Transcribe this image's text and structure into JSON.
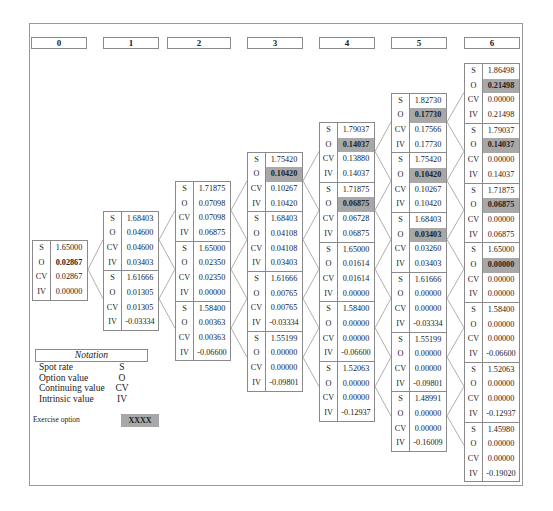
{
  "headers": [
    "0",
    "1",
    "2",
    "3",
    "4",
    "5",
    "6"
  ],
  "row_labels": [
    "S",
    "O",
    "CV",
    "IV"
  ],
  "colors": {
    "exercise_highlight": "#a8a8a8",
    "border": "#8a8a8a"
  },
  "columns": [
    {
      "step": "0",
      "nodes": [
        {
          "S": "1.65000",
          "O": "0.02867",
          "CV": "0.02867",
          "IV": "0.00000",
          "o_style": "bold"
        }
      ]
    },
    {
      "step": "1",
      "nodes": [
        {
          "S": "1.68403",
          "O": "0.04600",
          "CV": "0.04600",
          "IV": "0.03403"
        },
        {
          "S": "1.61666",
          "O": "0.01305",
          "CV": "0.01305",
          "IV": "-0.03334"
        }
      ]
    },
    {
      "step": "2",
      "nodes": [
        {
          "S": "1.71875",
          "O": "0.07098",
          "CV": "0.07098",
          "IV": "0.06875"
        },
        {
          "S": "1.65000",
          "O": "0.02350",
          "CV": "0.02350",
          "IV": "0.00000"
        },
        {
          "S": "1.58400",
          "O": "0.00363",
          "CV": "0.00363",
          "IV": "-0.06600"
        }
      ]
    },
    {
      "step": "3",
      "nodes": [
        {
          "S": "1.75420",
          "O": "0.10420",
          "CV": "0.10267",
          "IV": "0.10420",
          "o_style": "exercise"
        },
        {
          "S": "1.68403",
          "O": "0.04108",
          "CV": "0.04108",
          "IV": "0.03403"
        },
        {
          "S": "1.61666",
          "O": "0.00765",
          "CV": "0.00765",
          "IV": "-0.03334"
        },
        {
          "S": "1.55199",
          "O": "0.00000",
          "CV": "0.00000",
          "IV": "-0.09801"
        }
      ]
    },
    {
      "step": "4",
      "nodes": [
        {
          "S": "1.79037",
          "O": "0.14037",
          "CV": "0.13880",
          "IV": "0.14037",
          "o_style": "exercise"
        },
        {
          "S": "1.71875",
          "O": "0.06875",
          "CV": "0.06728",
          "IV": "0.06875",
          "o_style": "exercise"
        },
        {
          "S": "1.65000",
          "O": "0.01614",
          "CV": "0.01614",
          "IV": "0.00000"
        },
        {
          "S": "1.58400",
          "O": "0.00000",
          "CV": "0.00000",
          "IV": "-0.06600"
        },
        {
          "S": "1.52063",
          "O": "0.00000",
          "CV": "0.00000",
          "IV": "-0.12937"
        }
      ]
    },
    {
      "step": "5",
      "nodes": [
        {
          "S": "1.82730",
          "O": "0.17730",
          "CV": "0.17566",
          "IV": "0.17730",
          "o_style": "exercise"
        },
        {
          "S": "1.75420",
          "O": "0.10420",
          "CV": "0.10267",
          "IV": "0.10420",
          "o_style": "exercise"
        },
        {
          "S": "1.68403",
          "O": "0.03403",
          "CV": "0.03260",
          "IV": "0.03403",
          "o_style": "exercise"
        },
        {
          "S": "1.61666",
          "O": "0.00000",
          "CV": "0.00000",
          "IV": "-0.03334"
        },
        {
          "S": "1.55199",
          "O": "0.00000",
          "CV": "0.00000",
          "IV": "-0.09801"
        },
        {
          "S": "1.48991",
          "O": "0.00000",
          "CV": "0.00000",
          "IV": "-0.16009"
        }
      ]
    },
    {
      "step": "6",
      "nodes": [
        {
          "S": "1.86498",
          "O": "0.21498",
          "CV": "0.00000",
          "IV": "0.21498",
          "o_style": "exercise"
        },
        {
          "S": "1.79037",
          "O": "0.14037",
          "CV": "0.00000",
          "IV": "0.14037",
          "o_style": "exercise"
        },
        {
          "S": "1.71875",
          "O": "0.06875",
          "CV": "0.00000",
          "IV": "0.06875",
          "o_style": "exercise"
        },
        {
          "S": "1.65000",
          "O": "0.00000",
          "CV": "0.00000",
          "IV": "0.00000",
          "o_style": "exercise"
        },
        {
          "S": "1.58400",
          "O": "0.00000",
          "CV": "0.00000",
          "IV": "-0.06600"
        },
        {
          "S": "1.52063",
          "O": "0.00000",
          "CV": "0.00000",
          "IV": "-0.12937"
        },
        {
          "S": "1.45980",
          "O": "0.00000",
          "CV": "0.00000",
          "IV": "-0.19020"
        }
      ]
    }
  ],
  "legend": {
    "title": "Notation",
    "items": [
      {
        "label": "Spot rate",
        "abbr": "S"
      },
      {
        "label": "Option value",
        "abbr": "O"
      },
      {
        "label": "Continuing value",
        "abbr": "CV"
      },
      {
        "label": "Intrinsic value",
        "abbr": "IV"
      }
    ],
    "exercise_label": "Exercise option",
    "exercise_sample": "XXXX"
  }
}
